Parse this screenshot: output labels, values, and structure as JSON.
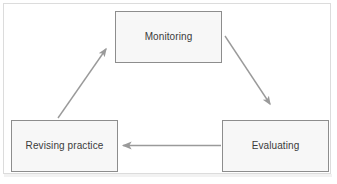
{
  "diagram": {
    "type": "cycle-flowchart",
    "background_color": "#ffffff",
    "frame_color": "#dcdcdc",
    "node_fill_color": "#f7f7f7",
    "node_border_color": "#8d8d8d",
    "node_text_color": "#3b3b3b",
    "arrow_color": "#9a9a9a",
    "nodes": [
      {
        "id": "monitoring",
        "label": "Monitoring"
      },
      {
        "id": "revising",
        "label": "Revising practice"
      },
      {
        "id": "evaluating",
        "label": "Evaluating"
      }
    ],
    "arrows": [
      {
        "id": "monitoring-to-evaluating",
        "from": "Monitoring",
        "to": "Evaluating",
        "direction": "down-right-diagonal"
      },
      {
        "id": "evaluating-to-revising",
        "from": "Evaluating",
        "to": "Revising practice",
        "direction": "left-horizontal"
      },
      {
        "id": "revising-to-monitoring",
        "from": "Revising practice",
        "to": "Monitoring",
        "direction": "up-right-diagonal"
      }
    ]
  }
}
